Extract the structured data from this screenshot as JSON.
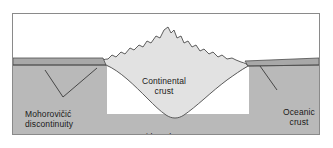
{
  "figure": {
    "frame_border_color": "#8a8a8a",
    "background_color": "#ffffff"
  },
  "colors": {
    "air": "#ffffff",
    "continental_crust": "#e2e2e2",
    "oceanic_crust": "#a8a8a8",
    "lithosphere": "#b9b9b9",
    "outline": "#4d4d4d",
    "leader_line": "#3a3a3a",
    "text": "#1a1a1a"
  },
  "labels": {
    "continental_crust": "Continental\ncrust",
    "lithosphere": "Lithosphere",
    "mohorovicic": "Mohorovičić\ndiscontinuity",
    "oceanic_crust": "Oceanic\ncrust"
  },
  "layers": [
    {
      "name": "air",
      "description": "White region above the crust surface"
    },
    {
      "name": "oceanic-crust",
      "description": "Thin darker grey band on both flanks"
    },
    {
      "name": "continental-crust",
      "description": "Light grey lens with jagged mountainous top and a deep downward root"
    },
    {
      "name": "lithosphere",
      "description": "Medium grey mantle mass below the Moho"
    }
  ],
  "leaders": [
    {
      "name": "moho-leader-left",
      "from": "Mohorovičić discontinuity label",
      "to": "oceanic Moho boundary on the left flank"
    },
    {
      "name": "moho-leader-right",
      "from": "Mohorovičić discontinuity label",
      "to": "continental crust root boundary"
    },
    {
      "name": "oceanic-crust-leader",
      "from": "Oceanic crust label",
      "to": "thin oceanic crust band on the right flank"
    }
  ]
}
